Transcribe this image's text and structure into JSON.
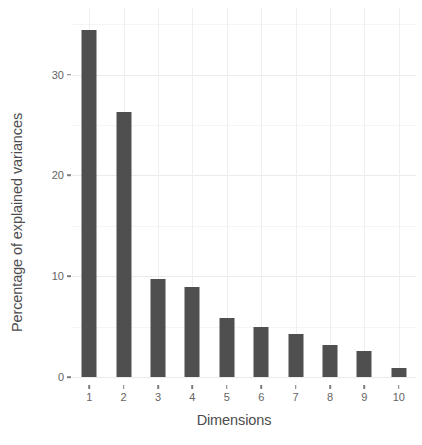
{
  "chart_data": {
    "type": "bar",
    "title": "",
    "subtitle": "",
    "xlabel": "Dimensions",
    "ylabel": "Percentage of explained variances",
    "categories": [
      "1",
      "2",
      "3",
      "4",
      "5",
      "6",
      "7",
      "8",
      "9",
      "10"
    ],
    "values": [
      34.4,
      26.3,
      9.7,
      8.9,
      5.9,
      5.0,
      4.3,
      3.2,
      2.6,
      0.9
    ],
    "series": [
      {
        "name": "Percentage of explained variances",
        "values": [
          34.4,
          26.3,
          9.7,
          8.9,
          5.9,
          5.0,
          4.3,
          3.2,
          2.6,
          0.9
        ]
      }
    ],
    "ylim": [
      0,
      36.6
    ],
    "xlim_categories": 10,
    "y_ticks": [
      0,
      10,
      20,
      30
    ],
    "y_tick_labels": [
      "0",
      "10",
      "20",
      "30"
    ],
    "y_minor_ticks": [
      5,
      15,
      25,
      35
    ],
    "x_ticks": [
      "1",
      "2",
      "3",
      "4",
      "5",
      "6",
      "7",
      "8",
      "9",
      "10"
    ],
    "grid": true,
    "grid_major_color": "#ebebeb",
    "grid_minor_color": "#f5f5f5",
    "legend": null,
    "legend_position": "none",
    "annotations": [],
    "bar_color": "#4f4f4f",
    "panel_background": "#ffffff",
    "axis_text_color": "#636363",
    "axis_title_color": "#4d4d4d"
  }
}
